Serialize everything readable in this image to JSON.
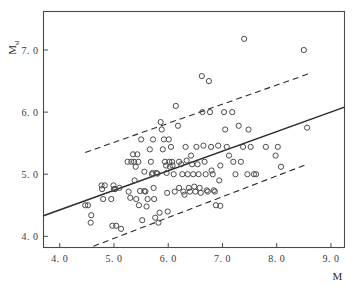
{
  "chart_data": {
    "type": "scatter",
    "title": "",
    "xlabel": "M",
    "ylabel": "M",
    "ylabel_subscript": "sl",
    "xlim": [
      3.7,
      9.25
    ],
    "ylim": [
      3.82,
      7.62
    ],
    "xticks": [
      4.0,
      5.0,
      6.0,
      7.0,
      8.0,
      9.0
    ],
    "yticks": [
      4.0,
      5.0,
      6.0,
      7.0
    ],
    "xtick_labels": [
      "4. 0",
      "5. 0",
      "6. 0",
      "7. 0",
      "8. 0",
      "9. 0"
    ],
    "ytick_labels": [
      "4. 0",
      "5. 0",
      "6. 0",
      "7. 0"
    ],
    "grid": false,
    "legend": "none",
    "marker": "open-circle",
    "marker_color": "#4a4a4a",
    "marker_radius": 2.6,
    "line_color": "#2b2b2b",
    "frame_color": "#4a4a4a",
    "series": [
      {
        "name": "regression-line",
        "style": "solid",
        "x": [
          3.7,
          9.25
        ],
        "y": [
          4.33,
          6.08
        ]
      },
      {
        "name": "upper-confidence-band",
        "style": "dashed",
        "x": [
          4.47,
          8.6
        ],
        "y": [
          5.35,
          6.62
        ]
      },
      {
        "name": "lower-confidence-band",
        "style": "dashed",
        "x": [
          4.62,
          8.56
        ],
        "y": [
          3.84,
          5.16
        ]
      }
    ],
    "points": [
      [
        4.47,
        4.5
      ],
      [
        4.52,
        4.5
      ],
      [
        4.57,
        4.22
      ],
      [
        4.58,
        4.34
      ],
      [
        4.77,
        4.82
      ],
      [
        4.78,
        4.76
      ],
      [
        4.8,
        4.6
      ],
      [
        4.83,
        4.82
      ],
      [
        4.95,
        4.6
      ],
      [
        4.97,
        4.17
      ],
      [
        4.99,
        4.82
      ],
      [
        5.0,
        4.76
      ],
      [
        5.02,
        4.76
      ],
      [
        5.04,
        4.17
      ],
      [
        5.13,
        4.12
      ],
      [
        5.25,
        5.2
      ],
      [
        5.27,
        4.72
      ],
      [
        5.3,
        4.62
      ],
      [
        5.32,
        5.2
      ],
      [
        5.35,
        5.32
      ],
      [
        5.37,
        5.2
      ],
      [
        5.38,
        4.9
      ],
      [
        5.4,
        5.12
      ],
      [
        5.41,
        4.6
      ],
      [
        5.43,
        5.32
      ],
      [
        5.45,
        5.2
      ],
      [
        5.46,
        4.5
      ],
      [
        5.48,
        4.73
      ],
      [
        5.5,
        5.56
      ],
      [
        5.52,
        4.26
      ],
      [
        5.56,
        4.73
      ],
      [
        5.58,
        4.72
      ],
      [
        5.6,
        4.48
      ],
      [
        5.62,
        4.6
      ],
      [
        5.66,
        5.4
      ],
      [
        5.68,
        5.2
      ],
      [
        5.7,
        5.0
      ],
      [
        5.71,
        5.02
      ],
      [
        5.72,
        5.56
      ],
      [
        5.73,
        4.78
      ],
      [
        5.74,
        4.6
      ],
      [
        5.76,
        4.3
      ],
      [
        5.78,
        5.02
      ],
      [
        5.8,
        5.01
      ],
      [
        5.82,
        4.22
      ],
      [
        5.84,
        4.38
      ],
      [
        5.86,
        5.84
      ],
      [
        5.88,
        5.72
      ],
      [
        5.9,
        5.4
      ],
      [
        5.92,
        5.56
      ],
      [
        5.94,
        5.2
      ],
      [
        5.96,
        5.14
      ],
      [
        5.97,
        5.02
      ],
      [
        5.98,
        4.7
      ],
      [
        5.99,
        4.4
      ],
      [
        6.01,
        5.56
      ],
      [
        6.02,
        5.2
      ],
      [
        6.03,
        5.12
      ],
      [
        6.05,
        5.44
      ],
      [
        6.07,
        5.2
      ],
      [
        6.08,
        5.14
      ],
      [
        6.1,
        5.0
      ],
      [
        6.12,
        4.72
      ],
      [
        6.14,
        6.1
      ],
      [
        6.18,
        5.78
      ],
      [
        6.2,
        5.2
      ],
      [
        6.24,
        5.16
      ],
      [
        6.26,
        5.0
      ],
      [
        6.28,
        4.72
      ],
      [
        6.3,
        4.67
      ],
      [
        6.32,
        5.44
      ],
      [
        6.34,
        5.22
      ],
      [
        6.36,
        5.0
      ],
      [
        6.38,
        4.78
      ],
      [
        6.4,
        4.72
      ],
      [
        6.42,
        5.3
      ],
      [
        6.44,
        5.16
      ],
      [
        6.46,
        5.0
      ],
      [
        6.48,
        4.8
      ],
      [
        6.5,
        4.72
      ],
      [
        6.52,
        5.44
      ],
      [
        6.54,
        5.16
      ],
      [
        6.56,
        5.0
      ],
      [
        6.58,
        4.78
      ],
      [
        6.6,
        4.7
      ],
      [
        6.62,
        6.58
      ],
      [
        6.63,
        6.0
      ],
      [
        6.65,
        5.46
      ],
      [
        6.67,
        5.2
      ],
      [
        6.69,
        5.0
      ],
      [
        6.71,
        4.74
      ],
      [
        6.73,
        4.72
      ],
      [
        6.75,
        6.5
      ],
      [
        6.77,
        6.0
      ],
      [
        6.79,
        5.44
      ],
      [
        6.8,
        5.06
      ],
      [
        6.82,
        5.0
      ],
      [
        6.84,
        4.74
      ],
      [
        6.86,
        4.72
      ],
      [
        6.88,
        4.5
      ],
      [
        6.92,
        5.46
      ],
      [
        6.94,
        4.9
      ],
      [
        6.96,
        4.49
      ],
      [
        7.03,
        6.0
      ],
      [
        7.05,
        5.72
      ],
      [
        7.08,
        5.44
      ],
      [
        7.12,
        5.3
      ],
      [
        7.18,
        6.0
      ],
      [
        7.2,
        5.2
      ],
      [
        7.24,
        5.0
      ],
      [
        7.3,
        5.78
      ],
      [
        7.34,
        5.2
      ],
      [
        7.38,
        5.44
      ],
      [
        7.4,
        7.18
      ],
      [
        7.46,
        5.0
      ],
      [
        7.48,
        5.72
      ],
      [
        7.52,
        5.44
      ],
      [
        7.58,
        5.0
      ],
      [
        7.62,
        5.0
      ],
      [
        7.8,
        5.44
      ],
      [
        7.98,
        5.3
      ],
      [
        8.02,
        5.44
      ],
      [
        8.08,
        5.12
      ],
      [
        8.5,
        7.0
      ],
      [
        8.56,
        5.75
      ],
      [
        6.96,
        5.14
      ],
      [
        6.2,
        4.78
      ],
      [
        5.56,
        5.04
      ],
      [
        5.1,
        4.78
      ]
    ]
  }
}
